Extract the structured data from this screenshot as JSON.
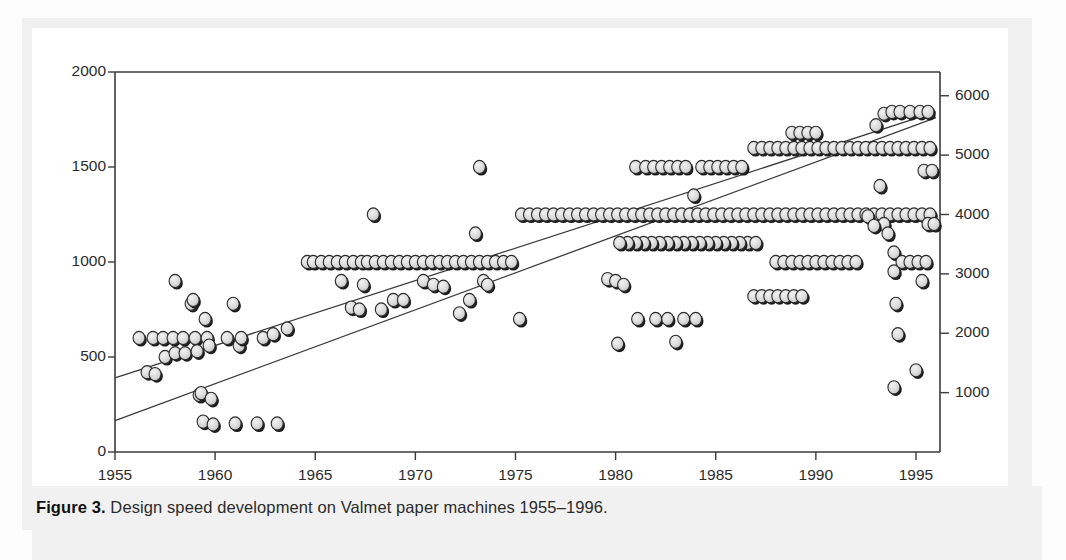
{
  "figure": {
    "caption_label": "Figure 3.",
    "caption_text": "Design speed development on Valmet paper machines 1955–1996."
  },
  "colors": {
    "axis": "#3a3a3a",
    "marker_fill": "#d6d6d6",
    "marker_edge": "#2a2a2a",
    "marker_shadow": "#1c1c1c",
    "trendline": "#3a3a3a",
    "panel_background": "#f1f1f1",
    "plot_background": "#ffffff",
    "text": "#2b2b2b"
  },
  "chart_data": {
    "type": "scatter",
    "title": "Design speed development on Valmet paper machines 1955–1996",
    "xlabel": "",
    "ylabel": "",
    "ylabel_right": "",
    "grid": false,
    "legend": "none",
    "xlim": [
      1955,
      1996.2
    ],
    "ylim": [
      0,
      2000
    ],
    "ylim_right": [
      0,
      6400
    ],
    "xticks": [
      1955,
      1960,
      1965,
      1970,
      1975,
      1980,
      1985,
      1990,
      1995
    ],
    "xticklabels": [
      "1955",
      "1960",
      "1965",
      "1970",
      "1975",
      "1980",
      "1985",
      "1990",
      "1995"
    ],
    "yticks": [
      0,
      500,
      1000,
      1500,
      2000
    ],
    "yticklabels": [
      "0",
      "500",
      "1000",
      "1500",
      "2000"
    ],
    "yticks_right": [
      1000,
      2000,
      3000,
      4000,
      5000,
      6000
    ],
    "yticklabels_right": [
      "1000",
      "2000",
      "3000",
      "4000",
      "5000",
      "6000"
    ],
    "units_left": "m/min",
    "units_right": "ft/min",
    "trendlines": [
      {
        "name": "upper-envelope",
        "x": [
          1955.0,
          1996.0
        ],
        "y": [
          390,
          1790
        ]
      },
      {
        "name": "lower-envelope",
        "x": [
          1955.0,
          1996.0
        ],
        "y": [
          165,
          1760
        ]
      }
    ],
    "series": [
      {
        "name": "Valmet paper machine design speed",
        "points": [
          [
            1956.2,
            600
          ],
          [
            1956.6,
            420
          ],
          [
            1957.0,
            410
          ],
          [
            1956.9,
            600
          ],
          [
            1957.4,
            600
          ],
          [
            1957.5,
            500
          ],
          [
            1957.9,
            600
          ],
          [
            1958.0,
            520
          ],
          [
            1958.0,
            900
          ],
          [
            1958.4,
            600
          ],
          [
            1958.5,
            520
          ],
          [
            1958.8,
            780
          ],
          [
            1958.9,
            800
          ],
          [
            1959.0,
            600
          ],
          [
            1959.1,
            530
          ],
          [
            1959.2,
            300
          ],
          [
            1959.3,
            310
          ],
          [
            1959.4,
            160
          ],
          [
            1959.5,
            700
          ],
          [
            1959.6,
            600
          ],
          [
            1959.7,
            560
          ],
          [
            1959.8,
            280
          ],
          [
            1959.9,
            145
          ],
          [
            1960.6,
            600
          ],
          [
            1960.9,
            780
          ],
          [
            1961.2,
            560
          ],
          [
            1961.3,
            600
          ],
          [
            1961.0,
            150
          ],
          [
            1962.1,
            150
          ],
          [
            1962.4,
            600
          ],
          [
            1962.9,
            620
          ],
          [
            1963.1,
            150
          ],
          [
            1963.6,
            650
          ],
          [
            1964.6,
            1000
          ],
          [
            1964.9,
            1000
          ],
          [
            1965.3,
            1000
          ],
          [
            1965.7,
            1000
          ],
          [
            1966.1,
            1000
          ],
          [
            1966.5,
            1000
          ],
          [
            1966.9,
            1000
          ],
          [
            1967.3,
            1000
          ],
          [
            1967.6,
            1000
          ],
          [
            1968.0,
            1000
          ],
          [
            1968.4,
            1000
          ],
          [
            1968.8,
            1000
          ],
          [
            1969.2,
            1000
          ],
          [
            1969.6,
            1000
          ],
          [
            1970.0,
            1000
          ],
          [
            1970.4,
            1000
          ],
          [
            1970.8,
            1000
          ],
          [
            1971.2,
            1000
          ],
          [
            1971.6,
            1000
          ],
          [
            1972.0,
            1000
          ],
          [
            1972.4,
            1000
          ],
          [
            1972.8,
            1000
          ],
          [
            1973.2,
            1000
          ],
          [
            1973.6,
            1000
          ],
          [
            1974.0,
            1000
          ],
          [
            1974.4,
            1000
          ],
          [
            1974.8,
            1000
          ],
          [
            1966.3,
            900
          ],
          [
            1966.8,
            760
          ],
          [
            1967.2,
            750
          ],
          [
            1967.4,
            880
          ],
          [
            1967.9,
            1250
          ],
          [
            1968.3,
            750
          ],
          [
            1968.9,
            800
          ],
          [
            1969.4,
            800
          ],
          [
            1970.4,
            900
          ],
          [
            1970.9,
            880
          ],
          [
            1971.4,
            870
          ],
          [
            1972.2,
            730
          ],
          [
            1972.7,
            800
          ],
          [
            1973.0,
            1150
          ],
          [
            1973.2,
            1500
          ],
          [
            1973.4,
            900
          ],
          [
            1973.6,
            880
          ],
          [
            1975.2,
            700
          ],
          [
            1975.3,
            1250
          ],
          [
            1975.7,
            1250
          ],
          [
            1976.1,
            1250
          ],
          [
            1976.5,
            1250
          ],
          [
            1976.9,
            1250
          ],
          [
            1977.3,
            1250
          ],
          [
            1977.7,
            1250
          ],
          [
            1978.1,
            1250
          ],
          [
            1978.5,
            1250
          ],
          [
            1978.9,
            1250
          ],
          [
            1979.3,
            1250
          ],
          [
            1979.7,
            1250
          ],
          [
            1980.1,
            1250
          ],
          [
            1980.5,
            1250
          ],
          [
            1980.9,
            1250
          ],
          [
            1981.3,
            1250
          ],
          [
            1981.7,
            1250
          ],
          [
            1982.1,
            1250
          ],
          [
            1982.5,
            1250
          ],
          [
            1982.9,
            1250
          ],
          [
            1983.3,
            1250
          ],
          [
            1983.7,
            1250
          ],
          [
            1984.1,
            1250
          ],
          [
            1984.5,
            1250
          ],
          [
            1984.9,
            1250
          ],
          [
            1985.3,
            1250
          ],
          [
            1985.7,
            1250
          ],
          [
            1986.1,
            1250
          ],
          [
            1986.5,
            1250
          ],
          [
            1986.9,
            1250
          ],
          [
            1987.3,
            1250
          ],
          [
            1987.7,
            1250
          ],
          [
            1988.1,
            1250
          ],
          [
            1988.5,
            1250
          ],
          [
            1988.9,
            1250
          ],
          [
            1989.3,
            1250
          ],
          [
            1989.7,
            1250
          ],
          [
            1990.1,
            1250
          ],
          [
            1990.5,
            1250
          ],
          [
            1990.9,
            1250
          ],
          [
            1991.3,
            1250
          ],
          [
            1991.7,
            1250
          ],
          [
            1992.1,
            1250
          ],
          [
            1992.5,
            1250
          ],
          [
            1992.9,
            1250
          ],
          [
            1993.3,
            1250
          ],
          [
            1993.7,
            1250
          ],
          [
            1994.1,
            1250
          ],
          [
            1994.5,
            1250
          ],
          [
            1994.9,
            1250
          ],
          [
            1995.3,
            1250
          ],
          [
            1995.7,
            1250
          ],
          [
            1981.0,
            1500
          ],
          [
            1981.5,
            1500
          ],
          [
            1981.9,
            1500
          ],
          [
            1982.3,
            1500
          ],
          [
            1982.7,
            1500
          ],
          [
            1983.1,
            1500
          ],
          [
            1983.5,
            1500
          ],
          [
            1983.9,
            1350
          ],
          [
            1984.3,
            1500
          ],
          [
            1984.7,
            1500
          ],
          [
            1985.1,
            1500
          ],
          [
            1985.5,
            1500
          ],
          [
            1985.9,
            1500
          ],
          [
            1986.3,
            1500
          ],
          [
            1986.9,
            1600
          ],
          [
            1987.3,
            1600
          ],
          [
            1987.7,
            1600
          ],
          [
            1988.1,
            1600
          ],
          [
            1988.5,
            1600
          ],
          [
            1988.9,
            1600
          ],
          [
            1989.3,
            1600
          ],
          [
            1989.7,
            1600
          ],
          [
            1990.1,
            1600
          ],
          [
            1990.5,
            1600
          ],
          [
            1990.9,
            1600
          ],
          [
            1991.3,
            1600
          ],
          [
            1991.7,
            1600
          ],
          [
            1992.1,
            1600
          ],
          [
            1992.5,
            1600
          ],
          [
            1992.9,
            1600
          ],
          [
            1993.3,
            1600
          ],
          [
            1993.7,
            1600
          ],
          [
            1994.1,
            1600
          ],
          [
            1994.5,
            1600
          ],
          [
            1994.9,
            1600
          ],
          [
            1995.3,
            1600
          ],
          [
            1995.7,
            1600
          ],
          [
            1988.8,
            1680
          ],
          [
            1989.2,
            1680
          ],
          [
            1989.6,
            1680
          ],
          [
            1990.0,
            1680
          ],
          [
            1993.0,
            1720
          ],
          [
            1993.4,
            1780
          ],
          [
            1993.8,
            1790
          ],
          [
            1994.2,
            1790
          ],
          [
            1994.7,
            1790
          ],
          [
            1995.2,
            1790
          ],
          [
            1995.6,
            1790
          ],
          [
            1986.6,
            1100
          ],
          [
            1987.0,
            1100
          ],
          [
            1986.2,
            1100
          ],
          [
            1985.8,
            1100
          ],
          [
            1985.4,
            1100
          ],
          [
            1985.0,
            1100
          ],
          [
            1984.6,
            1100
          ],
          [
            1984.2,
            1100
          ],
          [
            1983.8,
            1100
          ],
          [
            1983.4,
            1100
          ],
          [
            1983.0,
            1100
          ],
          [
            1982.6,
            1100
          ],
          [
            1982.2,
            1100
          ],
          [
            1981.8,
            1100
          ],
          [
            1981.4,
            1100
          ],
          [
            1981.0,
            1100
          ],
          [
            1980.6,
            1100
          ],
          [
            1980.2,
            1100
          ],
          [
            1988.0,
            1000
          ],
          [
            1988.4,
            1000
          ],
          [
            1988.8,
            1000
          ],
          [
            1989.2,
            1000
          ],
          [
            1989.6,
            1000
          ],
          [
            1990.0,
            1000
          ],
          [
            1990.4,
            1000
          ],
          [
            1990.8,
            1000
          ],
          [
            1991.2,
            1000
          ],
          [
            1991.6,
            1000
          ],
          [
            1992.0,
            1000
          ],
          [
            1986.9,
            820
          ],
          [
            1987.3,
            820
          ],
          [
            1987.7,
            820
          ],
          [
            1988.1,
            820
          ],
          [
            1988.5,
            820
          ],
          [
            1988.9,
            820
          ],
          [
            1989.3,
            820
          ],
          [
            1979.6,
            910
          ],
          [
            1980.0,
            900
          ],
          [
            1980.4,
            880
          ],
          [
            1980.1,
            570
          ],
          [
            1981.1,
            700
          ],
          [
            1982.0,
            700
          ],
          [
            1982.6,
            700
          ],
          [
            1983.4,
            700
          ],
          [
            1983.0,
            580
          ],
          [
            1984.0,
            700
          ],
          [
            1993.2,
            1400
          ],
          [
            1993.4,
            1200
          ],
          [
            1993.6,
            1150
          ],
          [
            1993.9,
            1050
          ],
          [
            1993.9,
            950
          ],
          [
            1994.0,
            780
          ],
          [
            1994.1,
            620
          ],
          [
            1993.9,
            340
          ],
          [
            1994.3,
            1000
          ],
          [
            1994.7,
            1000
          ],
          [
            1995.1,
            1000
          ],
          [
            1995.5,
            1000
          ],
          [
            1995.0,
            430
          ],
          [
            1995.3,
            900
          ],
          [
            1995.4,
            1480
          ],
          [
            1995.8,
            1480
          ],
          [
            1992.6,
            1240
          ],
          [
            1992.9,
            1190
          ],
          [
            1995.6,
            1200
          ],
          [
            1995.9,
            1200
          ]
        ]
      }
    ]
  }
}
